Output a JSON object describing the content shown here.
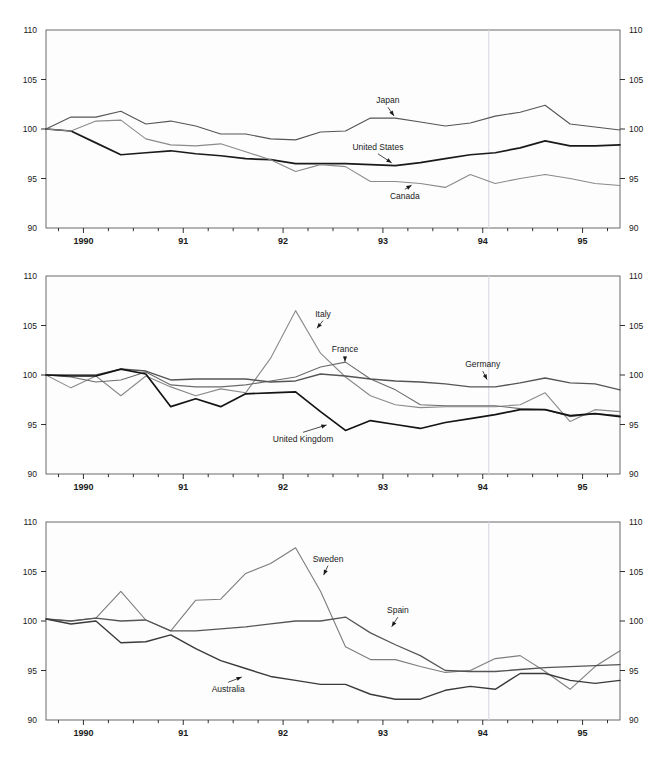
{
  "figure": {
    "width": 667,
    "height": 776,
    "background": "#ffffff",
    "panel_count": 3
  },
  "axis": {
    "y_ticks": [
      90,
      95,
      100,
      105,
      110
    ],
    "y_tick_labels": [
      "90",
      "95",
      "100",
      "105",
      "110"
    ],
    "y_min": 90,
    "y_max": 110,
    "x_year_labels": [
      "1990",
      "91",
      "92",
      "93",
      "94",
      "95"
    ],
    "x_min": 1989.625,
    "x_max": 1995.375,
    "x_minor_step_quarters": 1,
    "labels_both_sides": true
  },
  "chart_data": [
    {
      "type": "line",
      "panel": 1,
      "title": "",
      "xlabel": "",
      "ylabel": "",
      "ylim": [
        90,
        110
      ],
      "xlim": [
        1989.625,
        1995.375
      ],
      "grid": false,
      "legend": "inline-annotations",
      "x": [
        1989.625,
        1989.875,
        1990.125,
        1990.375,
        1990.625,
        1990.875,
        1991.125,
        1991.375,
        1991.625,
        1991.875,
        1992.125,
        1992.375,
        1992.625,
        1992.875,
        1993.125,
        1993.375,
        1993.625,
        1993.875,
        1994.125,
        1994.375,
        1994.625,
        1994.875,
        1995.125,
        1995.375
      ],
      "series": [
        {
          "name": "Japan",
          "color": "#555555",
          "width": 1.1,
          "label_x": 1993.05,
          "label_y": 102.6,
          "arrow_to_x": 1993.12,
          "arrow_to_y": 101.2,
          "values": [
            100.0,
            101.2,
            101.2,
            101.8,
            100.5,
            100.8,
            100.3,
            99.5,
            99.5,
            99.0,
            98.9,
            99.7,
            99.8,
            101.1,
            101.1,
            100.7,
            100.3,
            100.6,
            101.3,
            101.7,
            102.4,
            100.5,
            100.2,
            99.9
          ]
        },
        {
          "name": "United States",
          "color": "#1a1a1a",
          "width": 1.7,
          "label_x": 1992.95,
          "label_y": 97.9,
          "arrow_to_x": 1993.1,
          "arrow_to_y": 96.5,
          "values": [
            100.0,
            99.8,
            98.6,
            97.4,
            97.6,
            97.8,
            97.5,
            97.3,
            97.0,
            96.9,
            96.5,
            96.5,
            96.5,
            96.4,
            96.3,
            96.6,
            97.0,
            97.4,
            97.6,
            98.1,
            98.8,
            98.3,
            98.3,
            98.4
          ]
        },
        {
          "name": "Canada",
          "color": "#8a8a8a",
          "width": 1.1,
          "label_x": 1993.22,
          "label_y": 92.9,
          "arrow_to_x": 1993.3,
          "arrow_to_y": 94.4,
          "values": [
            100.0,
            99.8,
            100.8,
            100.9,
            99.0,
            98.4,
            98.3,
            98.5,
            97.7,
            96.9,
            95.7,
            96.4,
            96.2,
            94.7,
            94.7,
            94.5,
            94.1,
            95.4,
            94.5,
            95.0,
            95.4,
            95.0,
            94.5,
            94.3
          ]
        }
      ]
    },
    {
      "type": "line",
      "panel": 2,
      "title": "",
      "xlabel": "",
      "ylabel": "",
      "ylim": [
        90,
        110
      ],
      "xlim": [
        1989.625,
        1995.375
      ],
      "grid": false,
      "legend": "inline-annotations",
      "x": [
        1989.625,
        1989.875,
        1990.125,
        1990.375,
        1990.625,
        1990.875,
        1991.125,
        1991.375,
        1991.625,
        1991.875,
        1992.125,
        1992.375,
        1992.625,
        1992.875,
        1993.125,
        1993.375,
        1993.625,
        1993.875,
        1994.125,
        1994.375,
        1994.625,
        1994.875,
        1995.125,
        1995.375
      ],
      "series": [
        {
          "name": "Italy",
          "color": "#8a8a8a",
          "width": 1.1,
          "label_x": 1992.4,
          "label_y": 105.9,
          "arrow_to_x": 1992.33,
          "arrow_to_y": 104.6,
          "values": [
            100.0,
            98.7,
            99.9,
            97.9,
            99.9,
            98.8,
            97.9,
            98.6,
            98.2,
            101.7,
            106.5,
            102.2,
            99.8,
            97.9,
            97.0,
            96.7,
            96.8,
            96.8,
            96.8,
            97.0,
            98.2,
            95.3,
            96.5,
            96.3
          ]
        },
        {
          "name": "France",
          "color": "#6b6b6b",
          "width": 1.1,
          "label_x": 1992.62,
          "label_y": 102.3,
          "arrow_to_x": 1992.62,
          "arrow_to_y": 101.2,
          "values": [
            100.0,
            99.8,
            99.3,
            99.5,
            100.3,
            99.0,
            98.8,
            98.8,
            99.0,
            99.4,
            99.8,
            100.8,
            101.3,
            99.6,
            98.5,
            97.0,
            96.9,
            96.9,
            96.9,
            96.6,
            96.5,
            95.8,
            96.1,
            95.9
          ]
        },
        {
          "name": "Germany",
          "color": "#555555",
          "width": 1.4,
          "label_x": 1994.0,
          "label_y": 100.8,
          "arrow_to_x": 1994.05,
          "arrow_to_y": 99.4,
          "values": [
            100.0,
            100.0,
            100.0,
            100.6,
            100.4,
            99.5,
            99.6,
            99.6,
            99.6,
            99.3,
            99.4,
            100.1,
            99.9,
            99.6,
            99.4,
            99.3,
            99.1,
            98.8,
            98.8,
            99.2,
            99.7,
            99.2,
            99.1,
            98.5
          ]
        },
        {
          "name": "United Kingdom",
          "color": "#141414",
          "width": 1.7,
          "label_x": 1992.2,
          "label_y": 93.2,
          "arrow_to_x": 1992.45,
          "arrow_to_y": 95.0,
          "values": [
            100.0,
            99.9,
            99.9,
            100.6,
            100.1,
            96.8,
            97.6,
            96.8,
            98.1,
            98.2,
            98.3,
            96.3,
            94.4,
            95.4,
            95.0,
            94.6,
            95.2,
            95.6,
            96.0,
            96.5,
            96.5,
            95.9,
            96.1,
            95.8
          ]
        }
      ]
    },
    {
      "type": "line",
      "panel": 3,
      "title": "",
      "xlabel": "",
      "ylabel": "",
      "ylim": [
        90,
        110
      ],
      "xlim": [
        1989.625,
        1995.375
      ],
      "grid": false,
      "legend": "inline-annotations",
      "x": [
        1989.625,
        1989.875,
        1990.125,
        1990.375,
        1990.625,
        1990.875,
        1991.125,
        1991.375,
        1991.625,
        1991.875,
        1992.125,
        1992.375,
        1992.625,
        1992.875,
        1993.125,
        1993.375,
        1993.625,
        1993.875,
        1994.125,
        1994.375,
        1994.625,
        1994.875,
        1995.125,
        1995.375
      ],
      "series": [
        {
          "name": "Sweden",
          "color": "#7d7d7d",
          "width": 1.1,
          "label_x": 1992.45,
          "label_y": 106.0,
          "arrow_to_x": 1992.4,
          "arrow_to_y": 104.5,
          "values": [
            100.2,
            100.0,
            100.3,
            103.0,
            100.1,
            99.0,
            102.1,
            102.2,
            104.8,
            105.8,
            107.4,
            103.0,
            97.4,
            96.1,
            96.1,
            95.4,
            94.8,
            95.0,
            96.2,
            96.5,
            94.9,
            93.1,
            95.4,
            97.0
          ]
        },
        {
          "name": "Spain",
          "color": "#555555",
          "width": 1.3,
          "label_x": 1993.15,
          "label_y": 100.8,
          "arrow_to_x": 1993.08,
          "arrow_to_y": 99.3,
          "values": [
            100.2,
            100.0,
            100.3,
            100.0,
            100.1,
            99.0,
            99.0,
            99.2,
            99.4,
            99.7,
            100.0,
            100.0,
            100.4,
            98.8,
            97.6,
            96.5,
            95.0,
            94.9,
            94.9,
            95.1,
            95.3,
            95.4,
            95.5,
            95.6
          ]
        },
        {
          "name": "Australia",
          "color": "#3a3a3a",
          "width": 1.4,
          "label_x": 1991.45,
          "label_y": 92.8,
          "arrow_to_x": 1991.6,
          "arrow_to_y": 94.4,
          "values": [
            100.2,
            99.7,
            100.0,
            97.8,
            97.9,
            98.6,
            97.2,
            96.0,
            95.2,
            94.4,
            94.0,
            93.6,
            93.6,
            92.6,
            92.1,
            92.1,
            93.0,
            93.4,
            93.1,
            94.7,
            94.7,
            94.0,
            93.7,
            94.0
          ]
        }
      ]
    }
  ]
}
